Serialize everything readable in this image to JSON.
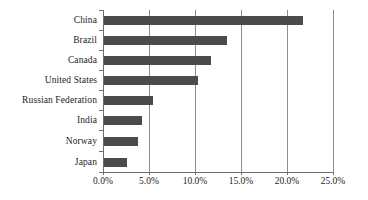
{
  "chart_data": {
    "type": "bar",
    "orientation": "horizontal",
    "title": "",
    "subtitle": "",
    "xlabel": "",
    "ylabel": "",
    "categories": [
      "China",
      "Brazil",
      "Canada",
      "United States",
      "Russian Federation",
      "India",
      "Norway",
      "Japan"
    ],
    "values": [
      21.6,
      13.4,
      11.6,
      10.2,
      5.3,
      4.1,
      3.7,
      2.5
    ],
    "value_labels": [
      "21.6%",
      "13.4%",
      "11.6%",
      "10.2%",
      "5.3%",
      "4.1%",
      "3.7%",
      "2.5%"
    ],
    "xlim": [
      0,
      25
    ],
    "xticks": [
      0,
      5,
      10,
      15,
      20,
      25
    ],
    "xtick_labels": [
      "0.0%",
      "5.0%",
      "10.0%",
      "15.0%",
      "20.0%",
      "25.0%"
    ],
    "grid": "vertical",
    "legend": "none",
    "series": [
      {
        "name": "",
        "values": [
          21.6,
          13.4,
          11.6,
          10.2,
          5.3,
          4.1,
          3.7,
          2.5
        ]
      }
    ]
  },
  "style": {
    "bar_color": "#4b4b4b",
    "grid_color": "#8d8d8d",
    "axis_color": "#6e6e6e",
    "text_color": "#1c1c1c",
    "background": "#ffffff"
  }
}
